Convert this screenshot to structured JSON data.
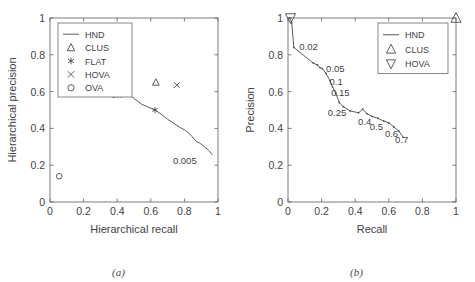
{
  "figure": {
    "panels": [
      {
        "id": "a",
        "caption": "(a)",
        "xlabel": "Hierarchical recall",
        "ylabel": "Hierarchical precision",
        "xticks": [
          "0",
          "0.2",
          "0.4",
          "0.6",
          "0.8",
          "1"
        ],
        "yticks": [
          "0",
          "0.2",
          "0.4",
          "0.6",
          "0.8",
          "1"
        ],
        "legend": [
          {
            "label": "HND",
            "marker": "line"
          },
          {
            "label": "CLUS",
            "marker": "triangle-up"
          },
          {
            "label": "FLAT",
            "marker": "asterisk"
          },
          {
            "label": "HOVA",
            "marker": "cross"
          },
          {
            "label": "OVA",
            "marker": "circle"
          }
        ],
        "annotations": [
          {
            "text": "0.7",
            "x": 0.455,
            "y": 0.585
          },
          {
            "text": "0.005",
            "x": 0.885,
            "y": 0.225
          }
        ]
      },
      {
        "id": "b",
        "caption": "(b)",
        "xlabel": "Recall",
        "ylabel": "Precision",
        "xticks": [
          "0",
          "0.2",
          "0.4",
          "0.6",
          "0.8",
          "1"
        ],
        "yticks": [
          "0",
          "0.2",
          "0.4",
          "0.6",
          "0.8",
          "1"
        ],
        "legend": [
          {
            "label": "HND",
            "marker": "line"
          },
          {
            "label": "CLUS",
            "marker": "triangle-up"
          },
          {
            "label": "HOVA",
            "marker": "triangle-down"
          }
        ],
        "annotations": [
          {
            "text": "0.02",
            "x": 0.055,
            "y": 0.845
          },
          {
            "text": "0.05",
            "x": 0.215,
            "y": 0.725
          },
          {
            "text": "0.1",
            "x": 0.235,
            "y": 0.655
          },
          {
            "text": "0.15",
            "x": 0.245,
            "y": 0.595
          },
          {
            "text": "0.25",
            "x": 0.225,
            "y": 0.485
          },
          {
            "text": "0.4",
            "x": 0.405,
            "y": 0.435
          },
          {
            "text": "0.5",
            "x": 0.475,
            "y": 0.41
          },
          {
            "text": "0.6",
            "x": 0.565,
            "y": 0.372
          },
          {
            "text": "0.7",
            "x": 0.625,
            "y": 0.34
          }
        ]
      }
    ]
  },
  "chart_data": [
    {
      "type": "line",
      "panel": "a",
      "title": "",
      "xlabel": "Hierarchical recall",
      "ylabel": "Hierarchical precision",
      "xlim": [
        0,
        1
      ],
      "ylim": [
        0,
        1
      ],
      "grid": false,
      "legend_position": "upper-left",
      "series": [
        {
          "name": "HND",
          "type": "line",
          "x": [
            0.455,
            0.5,
            0.545,
            0.585,
            0.625,
            0.66,
            0.7,
            0.74,
            0.775,
            0.805,
            0.84,
            0.87,
            0.895,
            0.92,
            0.945,
            0.965
          ],
          "y": [
            0.595,
            0.563,
            0.532,
            0.515,
            0.5,
            0.478,
            0.45,
            0.425,
            0.405,
            0.39,
            0.362,
            0.33,
            0.318,
            0.3,
            0.28,
            0.258
          ],
          "point_labels": [
            {
              "text": "0.7",
              "x": 0.455,
              "y": 0.595
            },
            {
              "text": "0.005",
              "x": 0.965,
              "y": 0.258
            }
          ]
        },
        {
          "name": "CLUS",
          "type": "scatter",
          "marker": "triangle-up",
          "x": [
            0.63
          ],
          "y": [
            0.65
          ]
        },
        {
          "name": "FLAT",
          "type": "scatter",
          "marker": "asterisk",
          "x": [
            0.625
          ],
          "y": [
            0.5
          ]
        },
        {
          "name": "HOVA",
          "type": "scatter",
          "marker": "cross",
          "x": [
            0.755
          ],
          "y": [
            0.635
          ]
        },
        {
          "name": "OVA",
          "type": "scatter",
          "marker": "circle",
          "x": [
            0.055
          ],
          "y": [
            0.14
          ]
        }
      ]
    },
    {
      "type": "line",
      "panel": "b",
      "title": "",
      "xlabel": "Recall",
      "ylabel": "Precision",
      "xlim": [
        0,
        1
      ],
      "ylim": [
        0,
        1
      ],
      "grid": false,
      "legend_position": "upper-right",
      "series": [
        {
          "name": "HND",
          "type": "line",
          "x": [
            0.01,
            0.022,
            0.035,
            0.15,
            0.175,
            0.19,
            0.205,
            0.225,
            0.25,
            0.265,
            0.285,
            0.305,
            0.33,
            0.37,
            0.42,
            0.445,
            0.47,
            0.5,
            0.535,
            0.57,
            0.6,
            0.63,
            0.66,
            0.685
          ],
          "y": [
            1.0,
            0.975,
            0.84,
            0.755,
            0.745,
            0.73,
            0.725,
            0.7,
            0.66,
            0.625,
            0.59,
            0.54,
            0.518,
            0.495,
            0.485,
            0.505,
            0.48,
            0.465,
            0.455,
            0.44,
            0.43,
            0.408,
            0.385,
            0.352
          ],
          "point_labels": [
            {
              "text": "0.02",
              "x": 0.035,
              "y": 0.84
            },
            {
              "text": "0.05",
              "x": 0.19,
              "y": 0.73
            },
            {
              "text": "0.1",
              "x": 0.225,
              "y": 0.7
            },
            {
              "text": "0.15",
              "x": 0.25,
              "y": 0.66
            },
            {
              "text": "0.25",
              "x": 0.33,
              "y": 0.518
            },
            {
              "text": "0.4",
              "x": 0.42,
              "y": 0.485
            },
            {
              "text": "0.5",
              "x": 0.5,
              "y": 0.465
            },
            {
              "text": "0.6",
              "x": 0.6,
              "y": 0.43
            },
            {
              "text": "0.7",
              "x": 0.685,
              "y": 0.352
            }
          ]
        },
        {
          "name": "CLUS",
          "type": "scatter",
          "marker": "triangle-up",
          "x": [
            1.0
          ],
          "y": [
            1.0
          ]
        },
        {
          "name": "HOVA",
          "type": "scatter",
          "marker": "triangle-down",
          "x": [
            0.015
          ],
          "y": [
            1.0
          ]
        }
      ]
    }
  ]
}
